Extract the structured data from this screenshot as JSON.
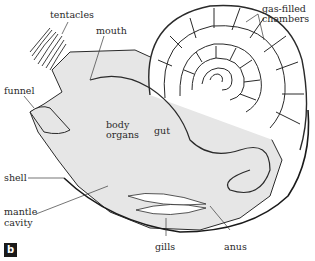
{
  "diagram": {
    "panel_label": "b",
    "labels": {
      "tentacles": "tentacles",
      "mouth": "mouth",
      "gas_filled": "gas-filled",
      "chambers": "chambers",
      "funnel": "funnel",
      "body": "body",
      "organs": "organs",
      "gut": "gut",
      "shell": "shell",
      "mantle": "mantle",
      "cavity": "cavity",
      "gills": "gills",
      "anus": "anus"
    },
    "colors": {
      "body_fill": "#e6e6e6",
      "shell_fill": "#ffffff",
      "outline": "#2a2a2a",
      "badge": "#1a1a1a"
    }
  }
}
